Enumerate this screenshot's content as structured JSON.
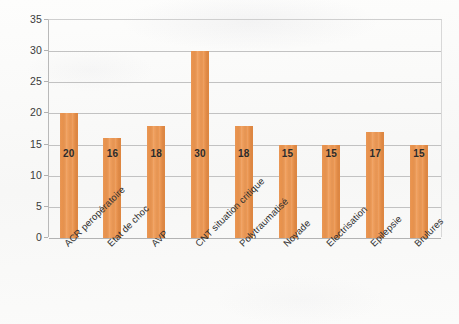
{
  "chart_data": {
    "type": "bar",
    "title": "",
    "subtitle": "",
    "xlabel": "",
    "ylabel": "",
    "ylim": [
      0,
      35
    ],
    "yticks": [
      0,
      5,
      10,
      15,
      20,
      25,
      30,
      35
    ],
    "grid": true,
    "legend": "none",
    "bar_color": "#ec9753",
    "categories": [
      "ACR peropératoire",
      "Etat de choc",
      "AVP",
      "CNT situation critique",
      "Polytraumatisé",
      "Noyade",
      "Electrisation",
      "Epilepsie",
      "Brulures"
    ],
    "values": [
      20,
      16,
      18,
      30,
      18,
      15,
      15,
      17,
      15
    ],
    "data_labels": [
      "20",
      "16",
      "18",
      "30",
      "18",
      "15",
      "15",
      "17",
      "15"
    ],
    "ytick_labels": [
      "0",
      "5",
      "10",
      "15",
      "20",
      "25",
      "30",
      "35"
    ]
  }
}
